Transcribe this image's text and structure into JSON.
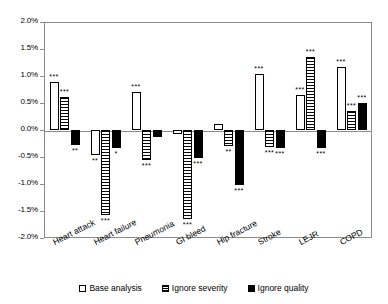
{
  "chart_data": {
    "type": "bar",
    "title": "",
    "xlabel": "",
    "ylabel": "",
    "ylim": [
      -2.0,
      2.0
    ],
    "ytick_step": 0.5,
    "ytick_labels": [
      "2.0%",
      "1.5%",
      "1.0%",
      "0.5%",
      "0.0%",
      "-0.5%",
      "-1.0%",
      "-1.5%",
      "-2.0%"
    ],
    "ytick_values": [
      2.0,
      1.5,
      1.0,
      0.5,
      0.0,
      -0.5,
      -1.0,
      -1.5,
      -2.0
    ],
    "grid": false,
    "legend_position": "bottom",
    "value_unit": "%",
    "categories": [
      "Heart attack",
      "Heart failure",
      "Pneumonia",
      "GI bleed",
      "Hip fracture",
      "Stroke",
      "LEJR",
      "COPD"
    ],
    "series": [
      {
        "name": "Base analysis",
        "color": "#ffffff",
        "pattern": "outline",
        "values": [
          0.88,
          -0.47,
          0.71,
          -0.08,
          0.11,
          1.04,
          0.64,
          1.16
        ],
        "significance": [
          "***",
          "**",
          "***",
          "",
          "",
          "***",
          "***",
          "***"
        ]
      },
      {
        "name": "Ignore severity",
        "color": "#000000",
        "pattern": "horizontal-hatch",
        "values": [
          0.62,
          -1.58,
          -0.55,
          -1.65,
          -0.3,
          -0.31,
          1.35,
          0.35
        ],
        "significance": [
          "***",
          "***",
          "***",
          "***",
          "**",
          "***",
          "***",
          "***"
        ]
      },
      {
        "name": "Ignore quality",
        "color": "#000000",
        "pattern": "solid",
        "values": [
          -0.28,
          -0.33,
          -0.13,
          -0.51,
          -1.02,
          -0.33,
          -0.33,
          0.5
        ],
        "significance": [
          "**",
          "*",
          "",
          "***",
          "***",
          "***",
          "***",
          "***"
        ]
      }
    ]
  },
  "legend": {
    "items": [
      {
        "label": "Base analysis",
        "style": "base"
      },
      {
        "label": "Ignore severity",
        "style": "sev"
      },
      {
        "label": "Ignore quality",
        "style": "qual"
      }
    ]
  }
}
